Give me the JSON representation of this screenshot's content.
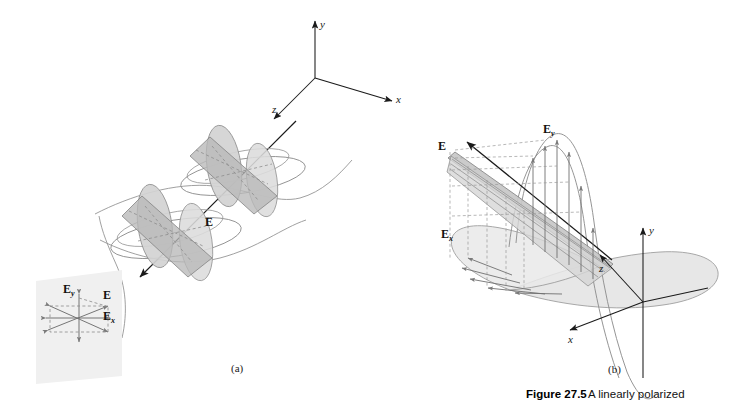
{
  "figure": {
    "caption_label": "Figure 27.5",
    "caption_text": "A linearly polarized",
    "panel_a_label": "(a)",
    "panel_b_label": "(b)"
  },
  "panel_a": {
    "axes": {
      "x": "x",
      "y": "y",
      "z": "z"
    },
    "field_label": "E",
    "inset": {
      "resultant": "E",
      "y_component": "E",
      "y_subscript": "y",
      "x_component": "E",
      "x_subscript": "x"
    }
  },
  "panel_b": {
    "axes": {
      "x": "x",
      "y": "y",
      "z": "z"
    },
    "field_label": "E",
    "y_component": "E",
    "y_subscript": "y",
    "x_component": "E",
    "x_subscript": "x"
  },
  "colors": {
    "stroke": "#6f6f6f",
    "dark_stroke": "#1a1a1a",
    "fill_light": "#e2e2e2",
    "fill_mid": "#c9c9c9",
    "fill_dark": "#b0b0b0",
    "inset_panel": "#f0f0f0",
    "dashed": "#8a8a8a"
  }
}
